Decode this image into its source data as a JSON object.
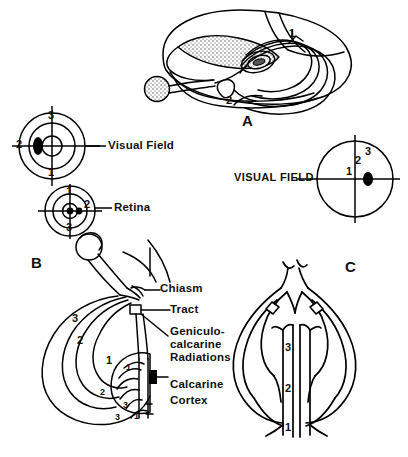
{
  "figure": {
    "background": "#ffffff",
    "ink": "#000000",
    "width": 408,
    "height": 457
  },
  "panels": [
    {
      "id": "A",
      "letter": "A",
      "description": "Lateral three-dimensional view of cerebral hemisphere with optic radiation fibers sweeping to the occipital pole"
    },
    {
      "id": "B",
      "letter": "B",
      "description": "Medial sagittal view of visual pathway from eye through chiasm, tract, geniculocalcarine radiations to calcarine cortex"
    },
    {
      "id": "C",
      "letter": "C",
      "description": "Inferior axial view of both optic nerves, chiasm, tracts and radiations converging on calcarine cortex"
    }
  ],
  "labels": {
    "visual_field_left": "Visual Field",
    "retina": "Retina",
    "visual_field_right": "VISUAL FIELD",
    "chiasm": "Chiasm",
    "tract": "Tract",
    "radiations_line1": "Geniculo-",
    "radiations_line2": "calcarine",
    "radiations_line3": "Radiations",
    "cortex_line1": "Calcarine",
    "cortex_line2": "Cortex"
  },
  "zones": {
    "legend": "Numbers mark corresponding retinotopic eccentricity zones along the whole visual pathway",
    "one": "1",
    "two": "2",
    "three": "3"
  },
  "visual_field_left_diagram": {
    "name": "visual-field-concentric",
    "center": {
      "x": 52,
      "y": 146
    },
    "rings": [
      33,
      23,
      10
    ],
    "ring_labels": [
      {
        "value": "3",
        "position": "top"
      },
      {
        "value": "2",
        "position": "left"
      },
      {
        "value": "1",
        "position": "bottom"
      }
    ],
    "scotoma": {
      "shape": "filled-oval",
      "side": "left-of-center",
      "color": "#000000"
    }
  },
  "retina_diagram": {
    "name": "retina-concentric",
    "center": {
      "x": 70,
      "y": 211
    },
    "rings": [
      25,
      17,
      8
    ],
    "ring_labels": [
      {
        "value": "1",
        "position": "top"
      },
      {
        "value": "2",
        "position": "right"
      },
      {
        "value": "3",
        "position": "bottom"
      }
    ],
    "image_point": {
      "shape": "filled-dot",
      "side": "right-of-center",
      "color": "#000000"
    }
  },
  "visual_field_right_diagram": {
    "name": "visual-field-single-circle",
    "center": {
      "x": 355,
      "y": 179
    },
    "radius": 38,
    "point_labels": [
      "1",
      "2",
      "3"
    ],
    "scotoma": {
      "shape": "filled-oval",
      "side": "right-of-center",
      "color": "#000000"
    }
  },
  "panel_a_zone_numbers": [
    "1",
    "2"
  ],
  "panel_b_zone_numbers": [
    "3",
    "2",
    "1",
    "1",
    "2",
    "3",
    "3",
    "3"
  ],
  "panel_c_zone_numbers": [
    "3",
    "2",
    "1"
  ],
  "caption": {
    "cut_off_text": "partially visible cut-off caption line at bottom edge"
  }
}
